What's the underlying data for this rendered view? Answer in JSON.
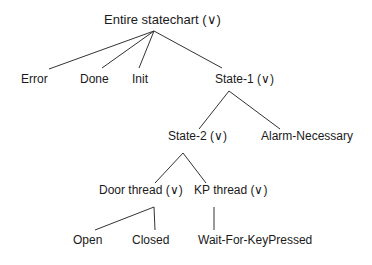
{
  "diagram": {
    "type": "tree",
    "edge_color": "#333333",
    "text_color": "#1a1a1a",
    "nodes": [
      {
        "id": "root",
        "label": "Entire statechart (∨)",
        "x": 104,
        "y": 13
      },
      {
        "id": "error",
        "label": "Error",
        "x": 21,
        "y": 72
      },
      {
        "id": "done",
        "label": "Done",
        "x": 80,
        "y": 72
      },
      {
        "id": "init",
        "label": "Init",
        "x": 132,
        "y": 72
      },
      {
        "id": "state1",
        "label": "State-1 (∨)",
        "x": 215,
        "y": 72
      },
      {
        "id": "state2",
        "label": "State-2 (∨)",
        "x": 168,
        "y": 129
      },
      {
        "id": "alarm",
        "label": "Alarm-Necessary",
        "x": 261,
        "y": 129
      },
      {
        "id": "door",
        "label": "Door thread (∨)",
        "x": 99,
        "y": 183
      },
      {
        "id": "kp",
        "label": "KP thread (∨)",
        "x": 194,
        "y": 183
      },
      {
        "id": "open",
        "label": "Open",
        "x": 73,
        "y": 233
      },
      {
        "id": "closed",
        "label": "Closed",
        "x": 132,
        "y": 233
      },
      {
        "id": "wait",
        "label": "Wait-For-KeyPressed",
        "x": 198,
        "y": 233
      }
    ],
    "edges": [
      {
        "from": "root",
        "to": "error",
        "x1": 154,
        "y1": 31,
        "x2": 49,
        "y2": 69
      },
      {
        "from": "root",
        "to": "done",
        "x1": 154,
        "y1": 31,
        "x2": 102,
        "y2": 68
      },
      {
        "from": "root",
        "to": "init",
        "x1": 154,
        "y1": 31,
        "x2": 139,
        "y2": 68
      },
      {
        "from": "root",
        "to": "state1",
        "x1": 154,
        "y1": 31,
        "x2": 222,
        "y2": 68
      },
      {
        "from": "state1",
        "to": "state2",
        "x1": 229,
        "y1": 91,
        "x2": 199,
        "y2": 129
      },
      {
        "from": "state1",
        "to": "alarm",
        "x1": 229,
        "y1": 91,
        "x2": 280,
        "y2": 129
      },
      {
        "from": "state2",
        "to": "door",
        "x1": 183,
        "y1": 153,
        "x2": 155,
        "y2": 183
      },
      {
        "from": "state2",
        "to": "kp",
        "x1": 183,
        "y1": 153,
        "x2": 206,
        "y2": 183
      },
      {
        "from": "door",
        "to": "open",
        "x1": 154,
        "y1": 207,
        "x2": 95,
        "y2": 230
      },
      {
        "from": "door",
        "to": "closed",
        "x1": 154,
        "y1": 207,
        "x2": 155,
        "y2": 230
      },
      {
        "from": "kp",
        "to": "wait",
        "x1": 214,
        "y1": 207,
        "x2": 214,
        "y2": 230
      }
    ]
  }
}
